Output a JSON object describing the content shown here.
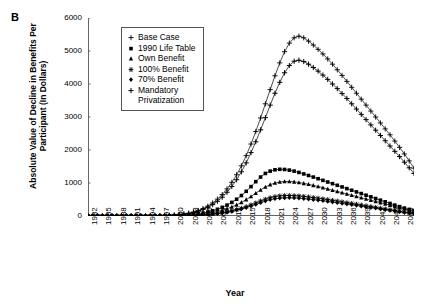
{
  "panel": {
    "label": "B"
  },
  "axes": {
    "ylabel": "Absolute Value of Decline in Benefits Per Participant (In Dollars)",
    "xlabel": "Year",
    "yticks": [
      "0",
      "1000",
      "2000",
      "3000",
      "4000",
      "5000",
      "6000"
    ],
    "xticks": [
      "1982",
      "1985",
      "1988",
      "1991",
      "1994",
      "1997",
      "2000",
      "2003",
      "2006",
      "2009",
      "2012",
      "2015",
      "2018",
      "2021",
      "2024",
      "2027",
      "2030",
      "2033",
      "2036",
      "2039",
      "2042",
      "2045",
      "2048"
    ]
  },
  "legend": {
    "items": [
      {
        "label": "Base Case",
        "marker": "plus-thin-icon"
      },
      {
        "label": "1990 Life Table",
        "marker": "square-icon"
      },
      {
        "label": "Own Benefit",
        "marker": "triangle-icon"
      },
      {
        "label": "100% Benefit",
        "marker": "star-icon"
      },
      {
        "label": "70% Benefit",
        "marker": "diamond-icon"
      },
      {
        "label": "Mandatory",
        "label2": "Privatization",
        "marker": "plus-icon"
      }
    ]
  },
  "chart_data": {
    "type": "line",
    "title": "",
    "xlabel": "Year",
    "ylabel": "Absolute Value of Decline in Benefits Per Participant (In Dollars)",
    "xlim": [
      1982,
      2050
    ],
    "ylim": [
      0,
      6000
    ],
    "grid": false,
    "legend_position": "upper-left-inside",
    "x": [
      1982,
      1983,
      1984,
      1985,
      1986,
      1987,
      1988,
      1989,
      1990,
      1991,
      1992,
      1993,
      1994,
      1995,
      1996,
      1997,
      1998,
      1999,
      2000,
      2001,
      2002,
      2003,
      2004,
      2005,
      2006,
      2007,
      2008,
      2009,
      2010,
      2011,
      2012,
      2013,
      2014,
      2015,
      2016,
      2017,
      2018,
      2019,
      2020,
      2021,
      2022,
      2023,
      2024,
      2025,
      2026,
      2027,
      2028,
      2029,
      2030,
      2031,
      2032,
      2033,
      2034,
      2035,
      2036,
      2037,
      2038,
      2039,
      2040,
      2041,
      2042,
      2043,
      2044,
      2045,
      2046,
      2047,
      2048,
      2049,
      2050
    ],
    "series": [
      {
        "name": "Base Case",
        "marker": "plus-thin-icon",
        "values": [
          0,
          0,
          0,
          0,
          0,
          0,
          0,
          0,
          0,
          0,
          0,
          0,
          0,
          0,
          0,
          5,
          10,
          18,
          28,
          42,
          60,
          85,
          120,
          165,
          225,
          300,
          395,
          510,
          650,
          820,
          1020,
          1250,
          1520,
          1830,
          2180,
          2560,
          2970,
          3400,
          3830,
          4250,
          4640,
          4980,
          5240,
          5400,
          5450,
          5400,
          5300,
          5180,
          5050,
          4910,
          4760,
          4600,
          4430,
          4260,
          4080,
          3900,
          3720,
          3540,
          3360,
          3180,
          3000,
          2820,
          2640,
          2460,
          2270,
          2080,
          1880,
          1670,
          1450
        ]
      },
      {
        "name": "Mandatory Privatization",
        "marker": "plus-icon",
        "values": [
          0,
          0,
          0,
          0,
          0,
          0,
          0,
          0,
          0,
          0,
          0,
          0,
          0,
          0,
          0,
          4,
          8,
          15,
          24,
          36,
          52,
          74,
          104,
          143,
          196,
          262,
          345,
          446,
          570,
          720,
          895,
          1100,
          1340,
          1610,
          1920,
          2250,
          2610,
          2980,
          3360,
          3720,
          4050,
          4340,
          4560,
          4690,
          4720,
          4680,
          4600,
          4500,
          4390,
          4270,
          4140,
          4000,
          3860,
          3710,
          3560,
          3400,
          3240,
          3080,
          2920,
          2760,
          2600,
          2440,
          2280,
          2120,
          1960,
          1800,
          1630,
          1460,
          1290
        ]
      },
      {
        "name": "1990 Life Table",
        "marker": "square-icon",
        "values": [
          0,
          0,
          0,
          0,
          0,
          0,
          0,
          0,
          0,
          0,
          0,
          0,
          0,
          0,
          0,
          1,
          3,
          6,
          10,
          16,
          24,
          34,
          48,
          66,
          90,
          120,
          158,
          204,
          262,
          330,
          412,
          508,
          620,
          748,
          890,
          1040,
          1180,
          1290,
          1360,
          1400,
          1415,
          1410,
          1390,
          1360,
          1320,
          1275,
          1228,
          1180,
          1130,
          1080,
          1030,
          980,
          930,
          880,
          830,
          780,
          730,
          680,
          630,
          580,
          530,
          480,
          430,
          380,
          330,
          285,
          240,
          200,
          165
        ]
      },
      {
        "name": "Own Benefit",
        "marker": "triangle-icon",
        "values": [
          0,
          0,
          0,
          0,
          0,
          0,
          0,
          0,
          0,
          0,
          0,
          0,
          0,
          0,
          0,
          1,
          2,
          4,
          7,
          11,
          16,
          23,
          32,
          44,
          60,
          80,
          105,
          136,
          174,
          220,
          275,
          338,
          412,
          496,
          590,
          690,
          790,
          880,
          950,
          1000,
          1030,
          1045,
          1045,
          1035,
          1015,
          990,
          960,
          928,
          894,
          858,
          820,
          782,
          744,
          706,
          668,
          630,
          592,
          554,
          516,
          478,
          440,
          402,
          364,
          326,
          288,
          250,
          212,
          176,
          142
        ]
      },
      {
        "name": "100% Benefit",
        "marker": "star-icon",
        "values": [
          0,
          0,
          0,
          0,
          0,
          0,
          0,
          0,
          0,
          0,
          0,
          0,
          0,
          0,
          0,
          0,
          1,
          2,
          4,
          6,
          9,
          13,
          18,
          25,
          34,
          45,
          60,
          78,
          100,
          126,
          158,
          194,
          236,
          284,
          338,
          396,
          455,
          510,
          556,
          590,
          610,
          620,
          622,
          618,
          608,
          594,
          578,
          560,
          540,
          520,
          498,
          476,
          454,
          430,
          406,
          382,
          358,
          334,
          310,
          286,
          262,
          238,
          214,
          190,
          166,
          142,
          118,
          96,
          76
        ]
      },
      {
        "name": "70% Benefit",
        "marker": "diamond-icon",
        "values": [
          0,
          0,
          0,
          0,
          0,
          0,
          0,
          0,
          0,
          0,
          0,
          0,
          0,
          0,
          0,
          0,
          1,
          2,
          3,
          5,
          8,
          11,
          16,
          22,
          30,
          40,
          53,
          69,
          89,
          112,
          140,
          172,
          210,
          252,
          300,
          350,
          404,
          452,
          492,
          522,
          540,
          549,
          551,
          547,
          538,
          526,
          512,
          496,
          478,
          460,
          441,
          421,
          401,
          381,
          360,
          339,
          318,
          297,
          276,
          255,
          234,
          213,
          192,
          171,
          150,
          129,
          108,
          88,
          70
        ]
      }
    ]
  }
}
